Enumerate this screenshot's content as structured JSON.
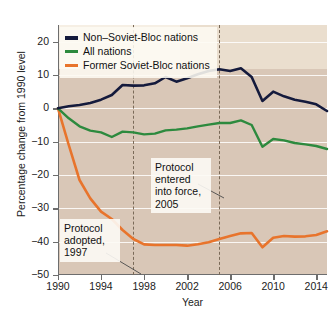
{
  "chart_data": {
    "type": "line",
    "title": "",
    "xlabel": "Year",
    "ylabel": "Percentage change from 1990 level",
    "xlim": [
      1990,
      2015
    ],
    "ylim": [
      -50,
      25
    ],
    "yticks": [
      20,
      10,
      0,
      -10,
      -20,
      -30,
      -40,
      -50
    ],
    "ytick_labels": [
      "20",
      "10",
      "0",
      "−10",
      "−20",
      "−30",
      "−40",
      "−50"
    ],
    "xticks": [
      1990,
      1994,
      1998,
      2002,
      2006,
      2010,
      2014
    ],
    "xtick_labels": [
      "1990",
      "1994",
      "1998",
      "2002",
      "2006",
      "2010",
      "2014"
    ],
    "grid": "horizontal-white",
    "legend_position": "top-left",
    "x": [
      1990,
      1991,
      1992,
      1993,
      1994,
      1995,
      1996,
      1997,
      1998,
      1999,
      2000,
      2001,
      2002,
      2003,
      2004,
      2005,
      2006,
      2007,
      2008,
      2009,
      2010,
      2011,
      2012,
      2013,
      2014,
      2015
    ],
    "series": [
      {
        "name": "Non–Soviet-Bloc nations",
        "color": "#141a3c",
        "values": [
          0.0,
          0.6,
          1.0,
          1.6,
          2.6,
          4.0,
          7.0,
          6.8,
          6.9,
          7.5,
          9.4,
          8.0,
          9.0,
          10.2,
          11.2,
          11.7,
          11.2,
          12.0,
          9.4,
          2.2,
          5.0,
          3.6,
          2.6,
          2.0,
          1.2,
          -0.8
        ]
      },
      {
        "name": "All nations",
        "color": "#2d8a3e",
        "values": [
          0.0,
          -3.0,
          -5.4,
          -6.7,
          -7.2,
          -8.6,
          -7.0,
          -7.2,
          -7.8,
          -7.6,
          -6.6,
          -6.4,
          -6.0,
          -5.4,
          -4.9,
          -4.4,
          -4.4,
          -3.6,
          -5.0,
          -11.5,
          -9.2,
          -9.6,
          -10.4,
          -10.8,
          -11.3,
          -12.2
        ]
      },
      {
        "name": "Former Soviet-Bloc nations",
        "color": "#e8742c",
        "values": [
          0.0,
          -11.0,
          -21.5,
          -27.0,
          -31.0,
          -33.2,
          -36.5,
          -39.2,
          -40.8,
          -41.0,
          -41.0,
          -41.0,
          -41.2,
          -40.8,
          -40.2,
          -39.2,
          -38.3,
          -37.5,
          -37.4,
          -41.7,
          -38.8,
          -38.3,
          -38.5,
          -38.4,
          -38.0,
          -36.9
        ]
      }
    ],
    "vlines": [
      {
        "name": "protocol-adopted",
        "x": 1997,
        "label": "Protocol adopted, 1997"
      },
      {
        "name": "protocol-in-force",
        "x": 2005,
        "label": "Protocol entered into force, 2005"
      }
    ],
    "annotations": [
      {
        "name": "annotation-protocol-adopted",
        "lines": [
          "Protocol",
          "adopted,",
          "1997"
        ],
        "points_to_x": 1997
      },
      {
        "name": "annotation-protocol-in-force",
        "lines": [
          "Protocol",
          "entered",
          "into force,",
          "2005"
        ],
        "points_to_x": 2005
      }
    ],
    "colors": {
      "plot_background": "#d9c7b7",
      "gridline": "#ffffff",
      "axis": "#6d6d6d",
      "vline": "#7a6a58",
      "navy": "#141a3c",
      "green": "#2d8a3e",
      "orange": "#e8742c"
    }
  },
  "axis": {
    "y_title": "Percentage change from 1990 level",
    "x_title": "Year",
    "y_labels": [
      "20",
      "10",
      "0",
      "−10",
      "−20",
      "−30",
      "−40",
      "−50"
    ],
    "x_labels": [
      "1990",
      "1994",
      "1998",
      "2002",
      "2006",
      "2010",
      "2014"
    ]
  },
  "legend": {
    "items": [
      {
        "label": "Non–Soviet-Bloc nations",
        "swatch": "navy-line-swatch"
      },
      {
        "label": "All nations",
        "swatch": "green-line-swatch"
      },
      {
        "label": "Former Soviet-Bloc nations",
        "swatch": "orange-line-swatch"
      }
    ]
  },
  "annotations": {
    "protocol_in_force": {
      "line1": "Protocol",
      "line2": "entered",
      "line3": "into force,",
      "line4": "2005"
    },
    "protocol_adopted": {
      "line1": "Protocol",
      "line2": "adopted,",
      "line3": "1997"
    }
  }
}
